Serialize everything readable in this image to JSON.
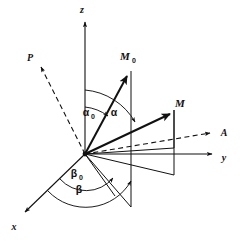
{
  "figure": {
    "name": "magnetization-vector-coordinate-diagram",
    "background_color": "#ffffff",
    "ink_color": "#111111",
    "width": 245,
    "height": 241
  },
  "axes": [
    {
      "id": "z",
      "label": "z",
      "label_x": 82,
      "label_y": 13,
      "tip_x": 85,
      "tip_y": 19,
      "origin_x": 85,
      "origin_y": 154
    },
    {
      "id": "y",
      "label": "y",
      "label_x": 224,
      "label_y": 161,
      "tip_x": 216,
      "tip_y": 155,
      "origin_x": 85,
      "origin_y": 154
    },
    {
      "id": "x",
      "label": "x",
      "label_x": 14,
      "label_y": 230,
      "tip_x": 22,
      "tip_y": 215,
      "origin_x": 85,
      "origin_y": 154
    }
  ],
  "vectors": [
    {
      "id": "M0",
      "label": "M",
      "subscript": "0",
      "label_x": 125,
      "label_y": 60,
      "tip_x": 129,
      "tip_y": 71,
      "origin_x": 85,
      "origin_y": 154,
      "meaning": "equilibrium-magnetization-vector"
    },
    {
      "id": "M",
      "label": "M",
      "subscript": "",
      "label_x": 180,
      "label_y": 107,
      "tip_x": 173,
      "tip_y": 110,
      "origin_x": 85,
      "origin_y": 154,
      "meaning": "magnetization-vector"
    }
  ],
  "dashed_axis": {
    "id": "PA",
    "start_label": "P",
    "start_label_x": 30,
    "start_label_y": 61,
    "start_x": 39,
    "start_y": 65,
    "end_label": "A",
    "end_label_x": 222,
    "end_label_y": 135,
    "end_x": 214,
    "end_y": 132,
    "meaning": "effective-field-axis"
  },
  "angles": [
    {
      "id": "alpha0",
      "label": "α",
      "subscript": "0",
      "label_x": 86,
      "label_y": 115,
      "meaning": "polar-angle-of-M0-from-z-axis"
    },
    {
      "id": "alpha",
      "label": "α",
      "subscript": "",
      "label_x": 113,
      "label_y": 115,
      "meaning": "polar-angle-of-M-from-z-axis"
    },
    {
      "id": "beta0",
      "label": "β",
      "subscript": "0",
      "label_x": 72,
      "label_y": 176,
      "meaning": "azimuthal-angle-of-M0-from-x-axis"
    },
    {
      "id": "beta",
      "label": "β",
      "subscript": "",
      "label_x": 77,
      "label_y": 192,
      "meaning": "azimuthal-angle-of-M-from-x-axis"
    }
  ],
  "planes": [
    {
      "id": "M0-plane",
      "note": "vertical projection line through M0"
    },
    {
      "id": "M-plane",
      "note": "quadrilateral projection plane containing M"
    }
  ]
}
